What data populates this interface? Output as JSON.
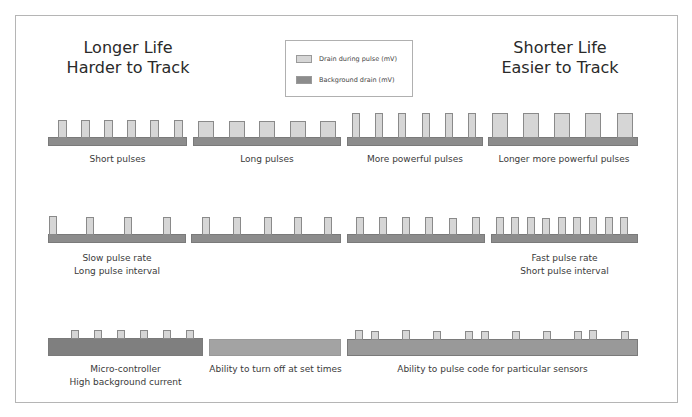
{
  "colors": {
    "pulse": "#d6d6d6",
    "background_drain": "#8c8c8c",
    "background_drain_light": "#a3a3a3",
    "frame": "#b5b5b5",
    "text": "#333333"
  },
  "titles": {
    "left": {
      "line1": "Longer Life",
      "line2": "Harder to Track"
    },
    "right": {
      "line1": "Shorter Life",
      "line2": "Easier to Track"
    }
  },
  "legend": {
    "items": [
      {
        "label": "Drain during pulse (mV)",
        "color": "#d6d6d6"
      },
      {
        "label": "Background drain (mV)",
        "color": "#8c8c8c"
      }
    ]
  },
  "rows": [
    {
      "panels": [
        {
          "caption": [
            "Short pulses"
          ]
        },
        {
          "caption": [
            "Long pulses"
          ]
        },
        {
          "caption": [
            "More powerful pulses"
          ]
        },
        {
          "caption": [
            "Longer more powerful pulses"
          ]
        }
      ]
    },
    {
      "panels": [
        {
          "caption": [
            "Slow pulse rate",
            "Long pulse interval"
          ]
        },
        {
          "caption": []
        },
        {
          "caption": []
        },
        {
          "caption": [
            "Fast pulse rate",
            "Short pulse interval"
          ]
        }
      ]
    },
    {
      "panels": [
        {
          "caption": [
            "Micro-controller",
            "High background current"
          ]
        },
        {
          "caption": [
            "Ability to turn off at set times"
          ]
        },
        {
          "caption": [
            "Ability to pulse code for particular sensors"
          ]
        }
      ]
    }
  ]
}
